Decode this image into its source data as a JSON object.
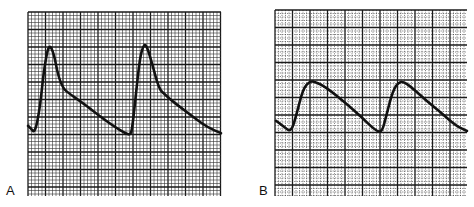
{
  "figure": {
    "panels": [
      {
        "label": "A"
      },
      {
        "label": "B"
      }
    ]
  },
  "colors": {
    "ink": "#111111",
    "grid_major": "#1a1a1a",
    "grid_minor": "#333333",
    "paper": "#ffffff"
  },
  "chart_data": [
    {
      "type": "line",
      "title": "",
      "panel_label": "A",
      "xlabel": "",
      "ylabel": "",
      "grid": true,
      "description": "Waveform with sharp, tall systolic upstroke and distinct shoulder on downslope; two beats",
      "x": [
        0,
        3,
        7,
        12,
        16,
        21,
        26,
        30,
        35,
        40,
        52,
        64,
        76,
        88,
        97,
        102,
        104,
        108,
        112,
        116,
        119,
        124,
        131,
        137,
        143,
        155,
        167,
        180,
        193
      ],
      "y": [
        0.1,
        0.07,
        0.02,
        0.3,
        0.72,
        1.0,
        0.88,
        0.65,
        0.51,
        0.46,
        0.37,
        0.27,
        0.17,
        0.08,
        0.02,
        0.0,
        0.05,
        0.45,
        0.85,
        0.99,
        0.96,
        0.78,
        0.5,
        0.44,
        0.38,
        0.28,
        0.18,
        0.08,
        0.02
      ]
    },
    {
      "type": "line",
      "title": "",
      "panel_label": "B",
      "xlabel": "",
      "ylabel": "",
      "grid": true,
      "description": "Damped waveform with lower, rounded peaks and slower upstroke; two beats",
      "x": [
        0,
        8,
        15,
        20,
        27,
        34,
        39,
        46,
        55,
        70,
        85,
        100,
        106,
        110,
        117,
        123,
        128,
        134,
        140,
        150,
        165,
        180,
        191
      ],
      "y": [
        0.22,
        0.1,
        0.0,
        0.3,
        0.85,
        1.0,
        0.98,
        0.92,
        0.8,
        0.56,
        0.3,
        0.02,
        0.0,
        0.3,
        0.82,
        0.98,
        0.98,
        0.9,
        0.8,
        0.62,
        0.38,
        0.12,
        0.02
      ]
    }
  ]
}
